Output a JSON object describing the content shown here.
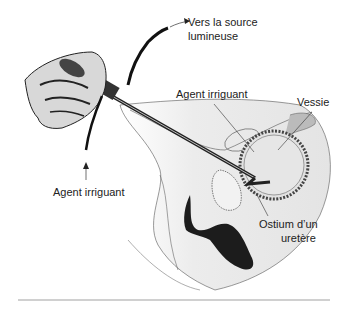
{
  "figure": {
    "labels": {
      "light_source_line1": "Vers la source",
      "light_source_line2": "lumineuse",
      "irrigant_top": "Agent irriguant",
      "bladder": "Vessie",
      "irrigant_left": "Agent irriguant",
      "ureter_line1": "Ostium d’un",
      "ureter_line2": "uretère"
    }
  },
  "colors": {
    "ink": "#222222",
    "skin_shade": "#e6e6e6",
    "tissue_dark": "#1a1a1a",
    "rule": "#d0d0d0"
  }
}
